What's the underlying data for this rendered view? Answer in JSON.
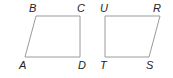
{
  "figure": {
    "shapes": [
      {
        "name": "ABCD",
        "vertices": [
          {
            "label": "A",
            "x": 25,
            "y": 57,
            "lx": 19,
            "ly": 69
          },
          {
            "label": "B",
            "x": 36,
            "y": 16,
            "lx": 29,
            "ly": 12
          },
          {
            "label": "C",
            "x": 80,
            "y": 16,
            "lx": 77,
            "ly": 12
          },
          {
            "label": "D",
            "x": 80,
            "y": 57,
            "lx": 78,
            "ly": 69
          }
        ]
      },
      {
        "name": "TURS",
        "vertices": [
          {
            "label": "T",
            "x": 105,
            "y": 57,
            "lx": 100,
            "ly": 69
          },
          {
            "label": "U",
            "x": 105,
            "y": 16,
            "lx": 100,
            "ly": 12
          },
          {
            "label": "R",
            "x": 160,
            "y": 16,
            "lx": 153,
            "ly": 12
          },
          {
            "label": "S",
            "x": 149,
            "y": 57,
            "lx": 146,
            "ly": 69
          }
        ]
      }
    ],
    "colors": {
      "edge": "#9a9a9a",
      "label": "#222222"
    }
  }
}
